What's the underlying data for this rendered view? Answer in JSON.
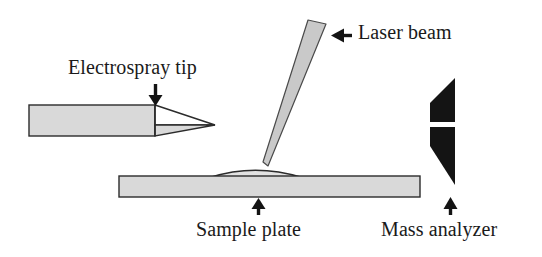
{
  "figure": {
    "background_color": "#ffffff",
    "width": 542,
    "height": 257,
    "labels": {
      "electrospray_tip": "Electrospray tip",
      "laser_beam": "Laser beam",
      "sample_plate": "Sample plate",
      "mass_analyzer": "Mass analyzer"
    },
    "colors": {
      "fill_light_gray": "#d9d9d9",
      "fill_mid_gray": "#c9c9c9",
      "stroke_dark": "#2b2b2b",
      "solid_black": "#141414",
      "text": "#1a1a1a"
    },
    "parts": [
      {
        "name": "electrospray-tip",
        "shape": "horizontal barrel with tapered open nib pointing right",
        "fill": "#d9d9d9",
        "pointer": "down-arrow"
      },
      {
        "name": "laser-beam",
        "shape": "long tapered wedge angled down-left to a point",
        "fill": "#c9c9c9",
        "pointer": "left-arrow"
      },
      {
        "name": "sample-plate",
        "shape": "horizontal slab with thin lens-shaped sample spot on top",
        "fill": "#d9d9d9",
        "pointer": "up-arrow"
      },
      {
        "name": "mass-analyzer",
        "shape": "solid black wedge split by a horizontal white slit",
        "fill": "#141414",
        "pointer": "up-arrow"
      }
    ]
  }
}
